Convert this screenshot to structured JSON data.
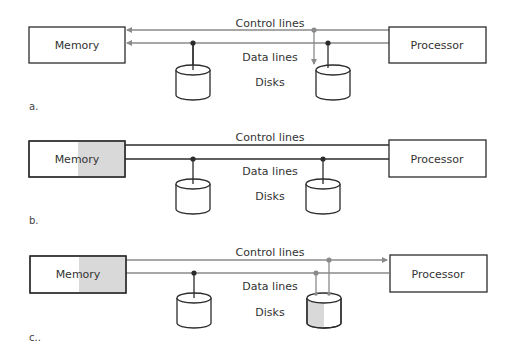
{
  "colors": {
    "line_dark": "#2b2b2b",
    "line_gray": "#8a8a8a",
    "shade": "#d9d9d9",
    "text": "#333333"
  },
  "panels": [
    {
      "id": "a",
      "panel_label": "a.",
      "memory_label": "Memory",
      "processor_label": "Processor",
      "control_label": "Control lines",
      "data_label": "Data lines",
      "disks_label": "Disks",
      "memory_shaded": false,
      "disk2_shaded": false
    },
    {
      "id": "b",
      "panel_label": "b.",
      "memory_label": "Memory",
      "processor_label": "Processor",
      "control_label": "Control lines",
      "data_label": "Data lines",
      "disks_label": "Disks",
      "memory_shaded": true,
      "disk2_shaded": false
    },
    {
      "id": "c",
      "panel_label": "c..",
      "memory_label": "Memory",
      "processor_label": "Processor",
      "control_label": "Control lines",
      "data_label": "Data lines",
      "disks_label": "Disks",
      "memory_shaded": true,
      "disk2_shaded": true
    }
  ]
}
